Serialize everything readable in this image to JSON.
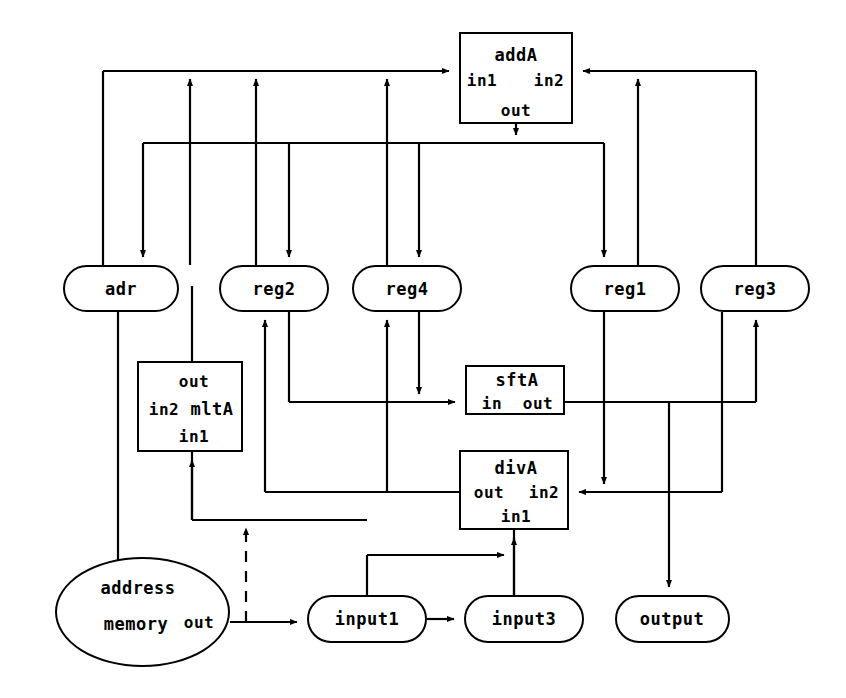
{
  "diagram": {
    "type": "block-dataflow",
    "stroke_color": "#000000",
    "background_color": "#ffffff",
    "width": 846,
    "height": 698
  },
  "nodes": [
    {
      "id": "addA",
      "shape": "rect",
      "x": 459,
      "y": 32,
      "w": 114,
      "h": 92,
      "ports": [
        {
          "name": "addA",
          "cx": 516,
          "cy": 55
        },
        {
          "name": "in1",
          "cx": 481,
          "cy": 80
        },
        {
          "name": "in2",
          "cx": 548,
          "cy": 80
        },
        {
          "name": "out",
          "cx": 516,
          "cy": 110
        }
      ]
    },
    {
      "id": "adr",
      "shape": "stadium",
      "x": 63,
      "y": 265,
      "w": 116,
      "h": 47,
      "ports": [
        {
          "name": "adr",
          "cx": 121,
          "cy": 289
        }
      ]
    },
    {
      "id": "reg2",
      "shape": "stadium",
      "x": 219,
      "y": 265,
      "w": 110,
      "h": 47,
      "ports": [
        {
          "name": "reg2",
          "cx": 274,
          "cy": 289
        }
      ]
    },
    {
      "id": "reg4",
      "shape": "stadium",
      "x": 352,
      "y": 265,
      "w": 110,
      "h": 47,
      "ports": [
        {
          "name": "reg4",
          "cx": 407,
          "cy": 289
        }
      ]
    },
    {
      "id": "reg1",
      "shape": "stadium",
      "x": 570,
      "y": 265,
      "w": 110,
      "h": 47,
      "ports": [
        {
          "name": "reg1",
          "cx": 625,
          "cy": 289
        }
      ]
    },
    {
      "id": "reg3",
      "shape": "stadium",
      "x": 700,
      "y": 265,
      "w": 110,
      "h": 47,
      "ports": [
        {
          "name": "reg3",
          "cx": 755,
          "cy": 289
        }
      ]
    },
    {
      "id": "mltA",
      "shape": "rect",
      "x": 137,
      "y": 361,
      "w": 106,
      "h": 91,
      "ports": [
        {
          "name": "out",
          "cx": 192,
          "cy": 381
        },
        {
          "name": "in2",
          "cx": 163,
          "cy": 408
        },
        {
          "name": "mltA",
          "cx": 210,
          "cy": 408
        },
        {
          "name": "in1",
          "cx": 192,
          "cy": 433
        }
      ]
    },
    {
      "id": "sftA",
      "shape": "rect",
      "x": 465,
      "y": 365,
      "w": 100,
      "h": 50,
      "ports": [
        {
          "name": "sftA",
          "cx": 515,
          "cy": 379
        },
        {
          "name": "in",
          "cx": 492,
          "cy": 402
        },
        {
          "name": "out",
          "cx": 537,
          "cy": 402
        }
      ]
    },
    {
      "id": "divA",
      "shape": "rect",
      "x": 459,
      "y": 450,
      "w": 110,
      "h": 80,
      "ports": [
        {
          "name": "divA",
          "cx": 514,
          "cy": 468
        },
        {
          "name": "out",
          "cx": 489,
          "cy": 492
        },
        {
          "name": "in2",
          "cx": 543,
          "cy": 492
        },
        {
          "name": "in1",
          "cx": 514,
          "cy": 515
        }
      ]
    },
    {
      "id": "memory",
      "shape": "ellipse",
      "x": 55,
      "y": 557,
      "w": 175,
      "h": 110,
      "ports": [
        {
          "name": "address",
          "cx": 138,
          "cy": 588
        },
        {
          "name": "memory",
          "cx": 136,
          "cy": 623
        },
        {
          "name": "out",
          "cx": 196,
          "cy": 622
        }
      ]
    },
    {
      "id": "input1",
      "shape": "stadium",
      "x": 307,
      "y": 595,
      "w": 120,
      "h": 48,
      "ports": [
        {
          "name": "input1",
          "cx": 367,
          "cy": 619
        }
      ]
    },
    {
      "id": "input3",
      "shape": "stadium",
      "x": 464,
      "y": 595,
      "w": 120,
      "h": 48,
      "ports": [
        {
          "name": "input3",
          "cx": 524,
          "cy": 619
        }
      ]
    },
    {
      "id": "output",
      "shape": "stadium",
      "x": 615,
      "y": 595,
      "w": 115,
      "h": 48,
      "ports": [
        {
          "name": "output",
          "cx": 672,
          "cy": 619
        }
      ]
    }
  ],
  "labels": {
    "addA": "addA",
    "addA_in1": "in1",
    "addA_in2": "in2",
    "addA_out": "out",
    "adr": "adr",
    "reg1": "reg1",
    "reg2": "reg2",
    "reg3": "reg3",
    "reg4": "reg4",
    "mltA": "mltA",
    "mltA_out": "out",
    "mltA_in1": "in1",
    "mltA_in2": "in2",
    "sftA": "sftA",
    "sftA_in": "in",
    "sftA_out": "out",
    "divA": "divA",
    "divA_out": "out",
    "divA_in1": "in1",
    "divA_in2": "in2",
    "memory": "memory",
    "memory_address": "address",
    "memory_out": "out",
    "input1": "input1",
    "input3": "input3",
    "output": "output"
  },
  "edges": [
    {
      "from": "adr",
      "to": "addA.in1",
      "style": "solid"
    },
    {
      "from": "addA.out",
      "to": "reg1",
      "style": "solid"
    },
    {
      "from": "reg2",
      "to": "addA.in1",
      "style": "solid"
    },
    {
      "from": "reg4",
      "to": "addA.in1",
      "style": "solid"
    },
    {
      "from": "reg1",
      "to": "addA.in2",
      "style": "solid"
    },
    {
      "from": "reg3",
      "to": "addA.in2",
      "style": "solid"
    },
    {
      "from": "addA.out",
      "to": "adr",
      "style": "solid"
    },
    {
      "from": "addA.out",
      "to": "reg2",
      "style": "solid"
    },
    {
      "from": "addA.out",
      "to": "reg4",
      "style": "solid"
    },
    {
      "from": "mltA.out",
      "to": "reg2",
      "style": "solid"
    },
    {
      "from": "reg2",
      "to": "sftA.in",
      "style": "solid"
    },
    {
      "from": "reg4",
      "to": "sftA.in",
      "style": "solid"
    },
    {
      "from": "sftA.out",
      "to": "reg3",
      "style": "solid"
    },
    {
      "from": "sftA.out",
      "to": "output",
      "style": "solid"
    },
    {
      "from": "reg1",
      "to": "divA.in2",
      "style": "solid"
    },
    {
      "from": "reg3",
      "to": "divA.in2",
      "style": "solid"
    },
    {
      "from": "divA.out",
      "to": "reg2",
      "style": "solid"
    },
    {
      "from": "divA.out",
      "to": "reg4",
      "style": "solid"
    },
    {
      "from": "input3",
      "to": "divA.in1",
      "style": "solid"
    },
    {
      "from": "input1",
      "to": "divA.in1",
      "style": "solid"
    },
    {
      "from": "memory.out",
      "to": "input1",
      "style": "solid"
    },
    {
      "from": "input1",
      "to": "input3",
      "style": "solid"
    },
    {
      "from": "adr",
      "to": "memory.address",
      "style": "solid"
    },
    {
      "from": "memory.out",
      "to": "mltA.in1",
      "style": "dashed"
    }
  ]
}
